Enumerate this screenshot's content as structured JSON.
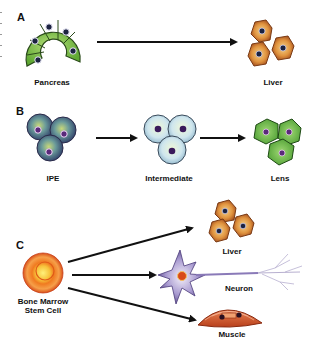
{
  "panels": [
    {
      "letter": "A",
      "source": {
        "label": "Pancreas",
        "color": "#7cc04a"
      },
      "targets": [
        {
          "label": "Liver",
          "color": "#d98a3c"
        }
      ]
    },
    {
      "letter": "B",
      "stages": [
        {
          "label": "IPE",
          "color": "#4a5a7a"
        },
        {
          "label": "Intermediate",
          "color": "#cfe6ee"
        },
        {
          "label": "Lens",
          "color": "#6cbf4a"
        }
      ]
    },
    {
      "letter": "C",
      "source": {
        "label_line1": "Bone Marrow",
        "label_line2": "Stem Cell",
        "color": "#f07a20"
      },
      "targets": [
        {
          "label": "Liver",
          "color": "#d98a3c"
        },
        {
          "label": "Neuron",
          "color": "#8a7ab8"
        },
        {
          "label": "Muscle",
          "color": "#d8603a"
        }
      ]
    }
  ],
  "colors": {
    "arrow": "#111111",
    "nucleus_dark": "#1c2340",
    "nucleus_purple": "#5a2a7a"
  }
}
